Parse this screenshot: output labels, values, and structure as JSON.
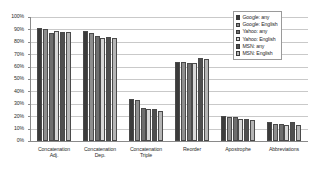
{
  "chart_data": {
    "type": "bar",
    "title": "",
    "subtitle": "",
    "xlabel": "",
    "ylabel": "",
    "ylim": [
      0,
      100
    ],
    "y_unit": "%",
    "grid": true,
    "legend_position": "top-right",
    "y_ticks": [
      "100%",
      "90%",
      "80%",
      "70%",
      "60%",
      "50%",
      "40%",
      "30%",
      "20%",
      "10%",
      "0%"
    ],
    "y_tick_values": [
      100,
      90,
      80,
      70,
      60,
      50,
      40,
      30,
      20,
      10,
      0
    ],
    "categories": [
      "Concatenation Adj.",
      "Concatenation Dep.",
      "Concatenation Triple",
      "Reorder",
      "Apostrophe",
      "Abbreviations"
    ],
    "category_lines": [
      [
        "Concatenation",
        "Adj."
      ],
      [
        "Concatenation",
        "Dep."
      ],
      [
        "Concatenation",
        "Triple"
      ],
      [
        "Reorder",
        ""
      ],
      [
        "Apostrophe",
        ""
      ],
      [
        "Abbreviations",
        ""
      ]
    ],
    "series": [
      {
        "name": "Google: any",
        "color": "#3b3b3b",
        "values": [
          91,
          89,
          34,
          64,
          20,
          15
        ]
      },
      {
        "name": "Google: English",
        "color": "#8e8e8e",
        "values": [
          90,
          87,
          33,
          64,
          19,
          14
        ]
      },
      {
        "name": "Yahoo: any",
        "color": "#6e6e6e",
        "values": [
          87,
          85,
          27,
          63,
          19,
          14
        ]
      },
      {
        "name": "Yahoo: English",
        "color": "#d8d8d8",
        "values": [
          89,
          83,
          26,
          63,
          18,
          13
        ]
      },
      {
        "name": "MSN: any",
        "color": "#4f4f4f",
        "values": [
          88,
          84,
          26,
          67,
          18,
          15
        ]
      },
      {
        "name": "MSN: English",
        "color": "#b5b5b5",
        "values": [
          88,
          83,
          24,
          66,
          17,
          13
        ]
      }
    ]
  }
}
